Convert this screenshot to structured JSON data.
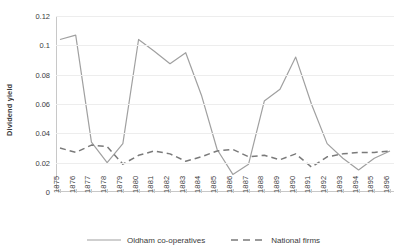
{
  "chart_data": {
    "type": "line",
    "title": "",
    "xlabel": "",
    "ylabel": "Dividend yield",
    "ylim": [
      0,
      0.12
    ],
    "ytick_labels": [
      "0.12",
      "0.1",
      "0.08",
      "0.06",
      "0.04",
      "0.02",
      "0"
    ],
    "ytick_values": [
      0.12,
      0.1,
      0.08,
      0.06,
      0.04,
      0.02,
      0
    ],
    "grid": true,
    "legend_position": "bottom",
    "categories": [
      "1875",
      "1876",
      "1877",
      "1878",
      "1879",
      "1880",
      "1881",
      "1882",
      "1883",
      "1884",
      "1885",
      "1886",
      "1887",
      "1888",
      "1889",
      "1890",
      "1891",
      "1892",
      "1893",
      "1894",
      "1895",
      "1896"
    ],
    "series": [
      {
        "name": "Oldham co-operatives",
        "style": "solid",
        "color": "#a0a0a0",
        "values": [
          0.104,
          0.107,
          0.034,
          0.02,
          0.033,
          0.104,
          0.096,
          0.0875,
          0.095,
          0.066,
          0.029,
          0.012,
          0.019,
          0.062,
          0.07,
          0.092,
          0.06,
          0.033,
          0.023,
          0.015,
          0.023,
          0.028
        ]
      },
      {
        "name": "National firms",
        "style": "dashed",
        "color": "#7a7a7a",
        "values": [
          0.03,
          0.027,
          0.032,
          0.031,
          0.019,
          0.025,
          0.028,
          0.026,
          0.021,
          0.024,
          0.028,
          0.029,
          0.024,
          0.025,
          0.022,
          0.026,
          0.017,
          0.024,
          0.026,
          0.027,
          0.027,
          0.028
        ]
      }
    ],
    "legend": [
      {
        "label": "Oldham co-operatives",
        "style": "solid",
        "color": "#a0a0a0"
      },
      {
        "label": "National firms",
        "style": "dashed",
        "color": "#7a7a7a"
      }
    ]
  }
}
